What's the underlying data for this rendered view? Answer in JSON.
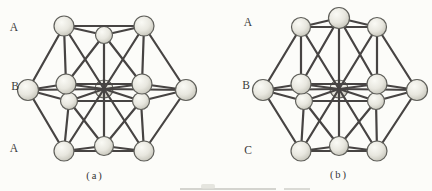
{
  "style": {
    "bond_color": "#474443",
    "bond_width": 2.2,
    "atom_stroke": "#5f5f5a",
    "atom_fill_light": "#fafaf5",
    "atom_fill_mid": "#e8e7df",
    "atom_fill_dark": "#c2c1b6",
    "label_color": "#3b3b3b",
    "page_color": "#fcfcf9"
  },
  "topology": {
    "bonds": [
      [
        "TL",
        "TC"
      ],
      [
        "TR",
        "TC"
      ],
      [
        "TL",
        "W"
      ],
      [
        "TL",
        "NW"
      ],
      [
        "TL",
        "M"
      ],
      [
        "TC",
        "NW"
      ],
      [
        "TC",
        "NE"
      ],
      [
        "TC",
        "M"
      ],
      [
        "TR",
        "NE"
      ],
      [
        "TR",
        "E"
      ],
      [
        "TR",
        "M"
      ],
      [
        "W",
        "NW"
      ],
      [
        "NW",
        "NE"
      ],
      [
        "NE",
        "E"
      ],
      [
        "E",
        "SE"
      ],
      [
        "SE",
        "SW"
      ],
      [
        "SW",
        "W"
      ],
      [
        "M",
        "W"
      ],
      [
        "M",
        "NW"
      ],
      [
        "M",
        "NE"
      ],
      [
        "M",
        "E"
      ],
      [
        "M",
        "SE"
      ],
      [
        "M",
        "SW"
      ],
      [
        "BL",
        "W"
      ],
      [
        "BL",
        "SW"
      ],
      [
        "BL",
        "M"
      ],
      [
        "BC",
        "SW"
      ],
      [
        "BC",
        "SE"
      ],
      [
        "BC",
        "M"
      ],
      [
        "BR",
        "E"
      ],
      [
        "BR",
        "SE"
      ],
      [
        "BR",
        "M"
      ],
      [
        "BL",
        "BC"
      ],
      [
        "BR",
        "BC"
      ],
      [
        "BL",
        "BR"
      ]
    ],
    "top_edge": [
      "TL",
      "TR"
    ]
  },
  "figures": [
    {
      "id": "a",
      "caption": "(a)",
      "labels": [
        "A",
        "B",
        "A"
      ],
      "top_center_in_front": false,
      "atoms": {
        "TL": {
          "x": 64,
          "y": 26,
          "r": 10,
          "layer": "A-top"
        },
        "TC": {
          "x": 104,
          "y": 35,
          "r": 8.5,
          "layer": "A-top"
        },
        "TR": {
          "x": 144,
          "y": 26,
          "r": 10,
          "layer": "A-top"
        },
        "W": {
          "x": 28,
          "y": 90,
          "r": 10.5,
          "layer": "B"
        },
        "NW": {
          "x": 66,
          "y": 84,
          "r": 10,
          "layer": "B"
        },
        "M": {
          "x": 104,
          "y": 89,
          "r": 9,
          "layer": "B"
        },
        "NE": {
          "x": 142,
          "y": 84,
          "r": 10,
          "layer": "B"
        },
        "E": {
          "x": 186,
          "y": 90,
          "r": 10.5,
          "layer": "B"
        },
        "SW": {
          "x": 69,
          "y": 101,
          "r": 8.5,
          "layer": "B"
        },
        "SE": {
          "x": 141,
          "y": 101,
          "r": 8.5,
          "layer": "B"
        },
        "BL": {
          "x": 64,
          "y": 151,
          "r": 10,
          "layer": "A-bottom"
        },
        "BC": {
          "x": 104,
          "y": 146,
          "r": 9.5,
          "layer": "A-bottom"
        },
        "BR": {
          "x": 144,
          "y": 151,
          "r": 10,
          "layer": "A-bottom"
        }
      }
    },
    {
      "id": "b",
      "caption": "(b)",
      "labels": [
        "A",
        "B",
        "C"
      ],
      "top_center_in_front": true,
      "atoms": {
        "TL": {
          "x": 301,
          "y": 27,
          "r": 9.5,
          "layer": "A"
        },
        "TC": {
          "x": 339,
          "y": 18,
          "r": 10.5,
          "layer": "A"
        },
        "TR": {
          "x": 377,
          "y": 27,
          "r": 9.5,
          "layer": "A"
        },
        "W": {
          "x": 263,
          "y": 90,
          "r": 10.5,
          "layer": "B"
        },
        "NW": {
          "x": 301,
          "y": 84,
          "r": 10,
          "layer": "B"
        },
        "M": {
          "x": 339,
          "y": 89,
          "r": 9,
          "layer": "B"
        },
        "NE": {
          "x": 377,
          "y": 84,
          "r": 10,
          "layer": "B"
        },
        "E": {
          "x": 417,
          "y": 90,
          "r": 10.5,
          "layer": "B"
        },
        "SW": {
          "x": 304,
          "y": 101,
          "r": 8.5,
          "layer": "B"
        },
        "SE": {
          "x": 376,
          "y": 101,
          "r": 8.5,
          "layer": "B"
        },
        "BL": {
          "x": 301,
          "y": 151,
          "r": 10,
          "layer": "C"
        },
        "BC": {
          "x": 339,
          "y": 146,
          "r": 9.5,
          "layer": "C"
        },
        "BR": {
          "x": 377,
          "y": 151,
          "r": 10,
          "layer": "C"
        }
      }
    }
  ]
}
